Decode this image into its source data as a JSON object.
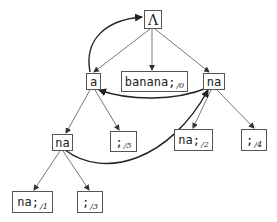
{
  "diagram": {
    "type": "suffix-tree",
    "nodes": [
      {
        "id": "root",
        "label": "Λ",
        "sub": ""
      },
      {
        "id": "a",
        "label": "a",
        "sub": ""
      },
      {
        "id": "banana",
        "label": "banana;",
        "sub": "/0"
      },
      {
        "id": "na_r",
        "label": "na",
        "sub": ""
      },
      {
        "id": "na_l",
        "label": "na",
        "sub": ""
      },
      {
        "id": "semi5",
        "label": ";",
        "sub": "/5"
      },
      {
        "id": "nasemi2",
        "label": "na;",
        "sub": "/2"
      },
      {
        "id": "semi4",
        "label": ";",
        "sub": "/4"
      },
      {
        "id": "nasemi1",
        "label": "na;",
        "sub": "/1"
      },
      {
        "id": "semi3",
        "label": ";",
        "sub": "/3"
      }
    ],
    "edges": [
      {
        "from": "root",
        "to": "a"
      },
      {
        "from": "root",
        "to": "banana"
      },
      {
        "from": "root",
        "to": "na_r"
      },
      {
        "from": "a",
        "to": "na_l"
      },
      {
        "from": "a",
        "to": "semi5"
      },
      {
        "from": "na_r",
        "to": "nasemi2"
      },
      {
        "from": "na_r",
        "to": "semi4"
      },
      {
        "from": "na_l",
        "to": "nasemi1"
      },
      {
        "from": "na_l",
        "to": "semi3"
      }
    ],
    "suffix_links": [
      {
        "from": "a",
        "to": "root"
      },
      {
        "from": "na_r",
        "to": "a"
      },
      {
        "from": "na_l",
        "to": "na_r"
      }
    ]
  }
}
